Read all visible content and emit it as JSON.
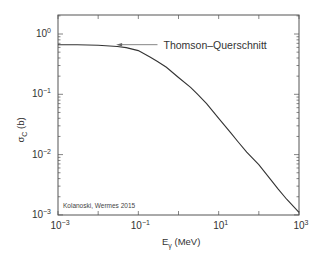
{
  "chart_data": {
    "type": "line",
    "title": "",
    "xlabel": "E_γ (MeV)",
    "xlabel_main": "E",
    "xlabel_sub": "γ",
    "xlabel_unit": " (MeV)",
    "ylabel": "σ_C (b)",
    "ylabel_main": "σ",
    "ylabel_sub": "C",
    "ylabel_unit": " (b)",
    "xscale": "log",
    "yscale": "log",
    "xlim": [
      0.001,
      1000
    ],
    "ylim": [
      0.001,
      2
    ],
    "grid": false,
    "legend": null,
    "x_ticks": [
      {
        "value": 0.001,
        "base": "10",
        "exp": "−3"
      },
      {
        "value": 0.1,
        "base": "10",
        "exp": "−1"
      },
      {
        "value": 10,
        "base": "10",
        "exp": "1"
      },
      {
        "value": 1000,
        "base": "10",
        "exp": "3"
      }
    ],
    "y_ticks": [
      {
        "value": 1,
        "base": "10",
        "exp": "0"
      },
      {
        "value": 0.1,
        "base": "10",
        "exp": "−1"
      },
      {
        "value": 0.01,
        "base": "10",
        "exp": "−2"
      },
      {
        "value": 0.001,
        "base": "10",
        "exp": "−3"
      }
    ],
    "series": [
      {
        "name": "Compton cross section σ_C",
        "color": "#333333",
        "x": [
          0.001,
          0.003,
          0.01,
          0.03,
          0.05,
          0.1,
          0.2,
          0.3,
          0.5,
          1,
          2,
          3,
          5,
          10,
          20,
          30,
          50,
          100,
          200,
          300,
          500,
          1000
        ],
        "y": [
          0.665,
          0.662,
          0.652,
          0.62,
          0.595,
          0.53,
          0.41,
          0.35,
          0.28,
          0.19,
          0.13,
          0.1,
          0.07,
          0.04,
          0.023,
          0.0165,
          0.011,
          0.0068,
          0.0038,
          0.0027,
          0.0018,
          0.0011
        ]
      }
    ],
    "annotations": [
      {
        "text": "Thomson–Querschnitt",
        "type": "arrow",
        "arrow_to": {
          "x": 0.028,
          "y": 0.665
        },
        "arrow_from": {
          "x": 0.3,
          "y": 0.665
        }
      },
      {
        "text": "Kolanoski, Wermes 2015",
        "type": "credit",
        "position": "bottom-left inside"
      }
    ]
  }
}
